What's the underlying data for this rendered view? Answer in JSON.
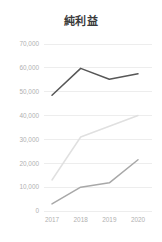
{
  "chart_data": {
    "type": "line",
    "title": "純利益",
    "xlabel": "",
    "ylabel": "",
    "categories": [
      "2017",
      "2018",
      "2019",
      "2020"
    ],
    "ylim": [
      0,
      70000
    ],
    "ytick_labels": [
      "70,000",
      "60,000",
      "50,000",
      "40,000",
      "30,000",
      "20,000",
      "10,000",
      "0"
    ],
    "ytick_values": [
      70000,
      60000,
      50000,
      40000,
      30000,
      20000,
      10000,
      0
    ],
    "grid": true,
    "legend": "none",
    "series": [
      {
        "name": "series-1",
        "color": "#575757",
        "values": [
          48500,
          59800,
          55200,
          57500
        ]
      },
      {
        "name": "series-2",
        "color": "#e0e0e0",
        "values": [
          13000,
          31000,
          35500,
          40000
        ]
      },
      {
        "name": "series-3",
        "color": "#a8a8a8",
        "values": [
          3000,
          10000,
          11800,
          21500
        ]
      }
    ]
  }
}
